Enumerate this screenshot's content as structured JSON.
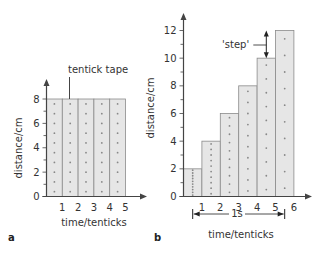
{
  "chart_data": [
    {
      "panel": "a",
      "type": "bar",
      "title": "",
      "annotation": "tentick tape",
      "xlabel": "time/tenticks",
      "ylabel": "distance/cm",
      "x_ticks": [
        "1",
        "2",
        "3",
        "4",
        "5"
      ],
      "y_ticks": [
        "0",
        "2",
        "4",
        "6",
        "8"
      ],
      "ylim": [
        0,
        8
      ],
      "categories": [
        "1",
        "2",
        "3",
        "4",
        "5"
      ],
      "values": [
        8,
        8,
        8,
        8,
        8
      ],
      "dots_per_strip": 10
    },
    {
      "panel": "b",
      "type": "bar",
      "title": "",
      "annotation": "'step'",
      "bracket_label": "1s",
      "xlabel": "time/tenticks",
      "ylabel": "distance/cm",
      "x_ticks": [
        "1",
        "2",
        "3",
        "4",
        "5",
        "6"
      ],
      "y_ticks": [
        "0",
        "2",
        "4",
        "6",
        "8",
        "10",
        "12"
      ],
      "ylim": [
        0,
        12
      ],
      "categories": [
        "1",
        "2",
        "3",
        "4",
        "5",
        "6"
      ],
      "values": [
        2,
        4,
        6,
        8,
        10,
        12
      ],
      "dots_per_strip": 10
    }
  ],
  "labels": {
    "panel_a": "a",
    "panel_b": "b",
    "tape": "tentick tape",
    "step": "'step'",
    "one_second": "1s",
    "xlabel": "time/tenticks",
    "ylabel": "distance/cm"
  }
}
